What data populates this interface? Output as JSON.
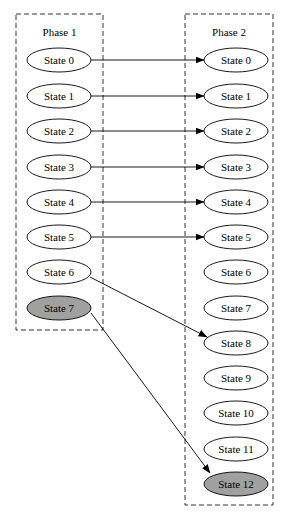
{
  "diagram": {
    "clusters": [
      {
        "id": "phase1",
        "label": "Phase 1",
        "x": 16,
        "y": 14,
        "w": 87,
        "h": 316
      },
      {
        "id": "phase2",
        "label": "Phase 2",
        "x": 185,
        "y": 14,
        "w": 88,
        "h": 491
      }
    ],
    "phase1_nodes": [
      {
        "label": "State 0",
        "cy": 60,
        "filled": false
      },
      {
        "label": "State 1",
        "cy": 96,
        "filled": false
      },
      {
        "label": "State 2",
        "cy": 131,
        "filled": false
      },
      {
        "label": "State 3",
        "cy": 167,
        "filled": false
      },
      {
        "label": "State 4",
        "cy": 202,
        "filled": false
      },
      {
        "label": "State 5",
        "cy": 237,
        "filled": false
      },
      {
        "label": "State 6",
        "cy": 272,
        "filled": false
      },
      {
        "label": "State 7",
        "cy": 308,
        "filled": true
      }
    ],
    "phase2_nodes": [
      {
        "label": "State 0",
        "cy": 60,
        "filled": false
      },
      {
        "label": "State 1",
        "cy": 96,
        "filled": false
      },
      {
        "label": "State 2",
        "cy": 131,
        "filled": false
      },
      {
        "label": "State 3",
        "cy": 167,
        "filled": false
      },
      {
        "label": "State 4",
        "cy": 202,
        "filled": false
      },
      {
        "label": "State 5",
        "cy": 237,
        "filled": false
      },
      {
        "label": "State 6",
        "cy": 272,
        "filled": false
      },
      {
        "label": "State 7",
        "cy": 308,
        "filled": false
      },
      {
        "label": "State 8",
        "cy": 343,
        "filled": false
      },
      {
        "label": "State 9",
        "cy": 378,
        "filled": false
      },
      {
        "label": "State 10",
        "cy": 413,
        "filled": false
      },
      {
        "label": "State 11",
        "cy": 449,
        "filled": false
      },
      {
        "label": "State 12",
        "cy": 484,
        "filled": true
      }
    ],
    "edges": [
      {
        "from": "Phase 1 / State 0",
        "to": "Phase 2 / State 0",
        "x1": 91,
        "y1": 60,
        "x2": 204,
        "y2": 60
      },
      {
        "from": "Phase 1 / State 1",
        "to": "Phase 2 / State 1",
        "x1": 91,
        "y1": 96,
        "x2": 204,
        "y2": 96
      },
      {
        "from": "Phase 1 / State 2",
        "to": "Phase 2 / State 2",
        "x1": 91,
        "y1": 131,
        "x2": 204,
        "y2": 131
      },
      {
        "from": "Phase 1 / State 3",
        "to": "Phase 2 / State 3",
        "x1": 91,
        "y1": 167,
        "x2": 204,
        "y2": 167
      },
      {
        "from": "Phase 1 / State 4",
        "to": "Phase 2 / State 4",
        "x1": 91,
        "y1": 202,
        "x2": 204,
        "y2": 202
      },
      {
        "from": "Phase 1 / State 5",
        "to": "Phase 2 / State 5",
        "x1": 91,
        "y1": 237,
        "x2": 204,
        "y2": 237
      },
      {
        "from": "Phase 1 / State 6",
        "to": "Phase 2 / State 8",
        "x1": 90,
        "y1": 277,
        "x2": 207,
        "y2": 337
      },
      {
        "from": "Phase 1 / State 7",
        "to": "Phase 2 / State 12",
        "x1": 91,
        "y1": 313,
        "x2": 210,
        "y2": 473
      }
    ],
    "colors": {
      "stroke": "#000000",
      "filled_node": "#a0a0a0",
      "cluster_border": "#333333",
      "background": "#ffffff"
    },
    "geometry": {
      "p1_cx": 59,
      "p2_cx": 236,
      "rx": 32,
      "ry": 12
    }
  }
}
